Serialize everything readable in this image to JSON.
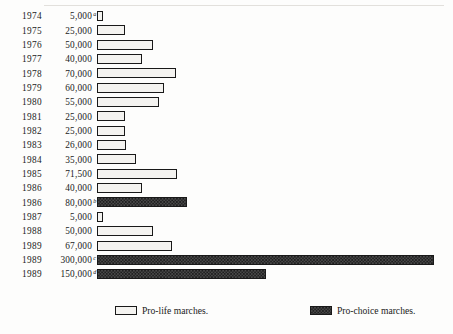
{
  "chart_data": {
    "type": "bar",
    "orientation": "horizontal",
    "title": "",
    "xlabel": "",
    "ylabel": "",
    "grid": false,
    "legend_position": "bottom",
    "xlim": [
      0,
      300000
    ],
    "categories": [
      "1974",
      "1975",
      "1976",
      "1977",
      "1978",
      "1979",
      "1980",
      "1981",
      "1982",
      "1983",
      "1984",
      "1985",
      "1986",
      "1986",
      "1987",
      "1988",
      "1989",
      "1989",
      "1989"
    ],
    "values": [
      5000,
      25000,
      50000,
      40000,
      70000,
      60000,
      55000,
      25000,
      25000,
      26000,
      35000,
      71500,
      40000,
      80000,
      5000,
      50000,
      67000,
      300000,
      150000
    ],
    "series": [
      {
        "name": "Pro-life marches.",
        "values": [
          5000,
          25000,
          50000,
          40000,
          70000,
          60000,
          55000,
          25000,
          25000,
          26000,
          35000,
          71500,
          40000,
          null,
          5000,
          50000,
          67000,
          null,
          null
        ]
      },
      {
        "name": "Pro-choice marches.",
        "values": [
          null,
          null,
          null,
          null,
          null,
          null,
          null,
          null,
          null,
          null,
          null,
          null,
          null,
          80000,
          null,
          null,
          null,
          300000,
          150000
        ]
      }
    ],
    "rows": [
      {
        "year": "1974",
        "value_label": "5,000",
        "value": 5000,
        "note": "a",
        "series": "prolife"
      },
      {
        "year": "1975",
        "value_label": "25,000",
        "value": 25000,
        "note": "",
        "series": "prolife"
      },
      {
        "year": "1976",
        "value_label": "50,000",
        "value": 50000,
        "note": "",
        "series": "prolife"
      },
      {
        "year": "1977",
        "value_label": "40,000",
        "value": 40000,
        "note": "",
        "series": "prolife"
      },
      {
        "year": "1978",
        "value_label": "70,000",
        "value": 70000,
        "note": "",
        "series": "prolife"
      },
      {
        "year": "1979",
        "value_label": "60,000",
        "value": 60000,
        "note": "",
        "series": "prolife"
      },
      {
        "year": "1980",
        "value_label": "55,000",
        "value": 55000,
        "note": "",
        "series": "prolife"
      },
      {
        "year": "1981",
        "value_label": "25,000",
        "value": 25000,
        "note": "",
        "series": "prolife"
      },
      {
        "year": "1982",
        "value_label": "25,000",
        "value": 25000,
        "note": "",
        "series": "prolife"
      },
      {
        "year": "1983",
        "value_label": "26,000",
        "value": 26000,
        "note": "",
        "series": "prolife"
      },
      {
        "year": "1984",
        "value_label": "35,000",
        "value": 35000,
        "note": "",
        "series": "prolife"
      },
      {
        "year": "1985",
        "value_label": "71,500",
        "value": 71500,
        "note": "",
        "series": "prolife"
      },
      {
        "year": "1986",
        "value_label": "40,000",
        "value": 40000,
        "note": "",
        "series": "prolife"
      },
      {
        "year": "1986",
        "value_label": "80,000",
        "value": 80000,
        "note": "b",
        "series": "prochoice"
      },
      {
        "year": "1987",
        "value_label": "5,000",
        "value": 5000,
        "note": "",
        "series": "prolife"
      },
      {
        "year": "1988",
        "value_label": "50,000",
        "value": 50000,
        "note": "",
        "series": "prolife"
      },
      {
        "year": "1989",
        "value_label": "67,000",
        "value": 67000,
        "note": "",
        "series": "prolife"
      },
      {
        "year": "1989",
        "value_label": "300,000",
        "value": 300000,
        "note": "c",
        "series": "prochoice"
      },
      {
        "year": "1989",
        "value_label": "150,000",
        "value": 150000,
        "note": "d",
        "series": "prochoice"
      }
    ],
    "legend": [
      {
        "key": "prolife",
        "label": "Pro-life marches."
      },
      {
        "key": "prochoice",
        "label": "Pro-choice marches."
      }
    ],
    "colors": {
      "bar_outline": "#191919",
      "prolife_fill": "#f4f3f0",
      "prochoice_fill": "#1c1c1c",
      "background": "#fdfdfc",
      "text": "#1a1a1a"
    }
  }
}
